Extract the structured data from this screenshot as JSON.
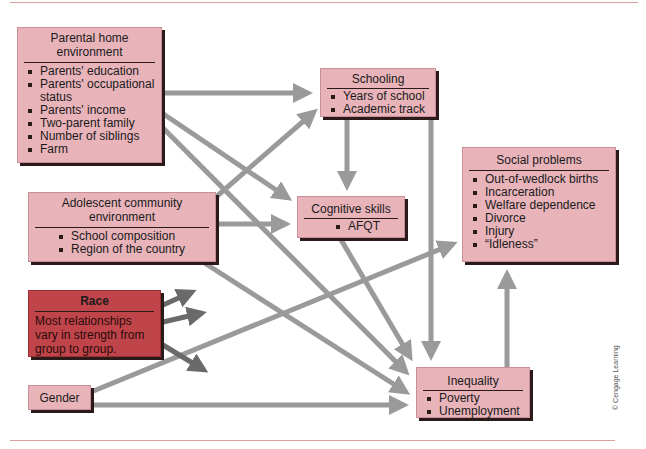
{
  "boxes": {
    "parental": {
      "title": "Parental home environment",
      "items": [
        "Parents' education",
        "Parents' occupational status",
        "Parents' income",
        "Two-parent family",
        "Number of siblings",
        "Farm"
      ]
    },
    "adolescent": {
      "title": "Adolescent community environment",
      "items": [
        "School composition",
        "Region of the country"
      ]
    },
    "race": {
      "title": "Race",
      "description": "Most relationships vary in strength from group to group."
    },
    "gender": {
      "title": "Gender"
    },
    "schooling": {
      "title": "Schooling",
      "items": [
        "Years of school",
        "Academic track"
      ]
    },
    "cognitive": {
      "title": "Cognitive skills",
      "items": [
        "AFQT"
      ]
    },
    "social": {
      "title": "Social problems",
      "items": [
        "Out-of-wedlock births",
        "Incarceration",
        "Welfare dependence",
        "Divorce",
        "Injury",
        "“Idleness”"
      ]
    },
    "inequality": {
      "title": "Inequality",
      "items": [
        "Poverty",
        "Unemployment"
      ]
    }
  },
  "edges": [
    {
      "from": "parental",
      "to": "schooling"
    },
    {
      "from": "parental",
      "to": "cognitive"
    },
    {
      "from": "parental",
      "to": "inequality"
    },
    {
      "from": "adolescent",
      "to": "schooling"
    },
    {
      "from": "adolescent",
      "to": "cognitive"
    },
    {
      "from": "adolescent",
      "to": "inequality"
    },
    {
      "from": "schooling",
      "to": "cognitive"
    },
    {
      "from": "schooling",
      "to": "inequality"
    },
    {
      "from": "cognitive",
      "to": "inequality"
    },
    {
      "from": "gender",
      "to": "social"
    },
    {
      "from": "gender",
      "to": "inequality"
    },
    {
      "from": "inequality",
      "to": "social"
    },
    {
      "from": "race",
      "to": "unspecified-1"
    },
    {
      "from": "race",
      "to": "unspecified-2"
    },
    {
      "from": "race",
      "to": "unspecified-3"
    }
  ],
  "colors": {
    "box_fill": "#e8b4ba",
    "race_fill": "#c0454a",
    "arrow": "#9a9a9a",
    "race_arrow": "#6a6a6a",
    "rule": "#d9a0a0"
  },
  "credit": "© Cengage Learning"
}
